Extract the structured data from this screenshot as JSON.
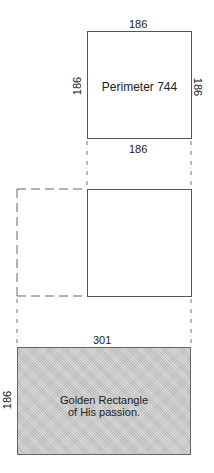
{
  "diagram": {
    "square": {
      "top_label": "186",
      "left_label": "186",
      "right_label": "186",
      "center_label": "Perimeter 744",
      "bottom_label": "186"
    },
    "transition": {
      "dashed_extension_label": ""
    },
    "golden_rectangle": {
      "width_label": "301",
      "height_label": "186",
      "caption_line1": "Golden Rectangle",
      "caption_line2": "of His passion."
    },
    "colors": {
      "line": "#555555",
      "dashed": "#666666",
      "fill": "#cfcfcf",
      "text": "#222222"
    }
  }
}
